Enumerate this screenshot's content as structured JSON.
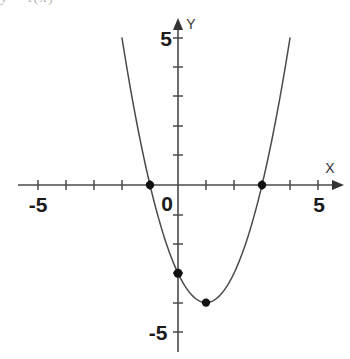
{
  "figure": {
    "title_fragment": "y = f(x)",
    "background_color": "#ffffff",
    "curve_color": "#4a4a4a",
    "axis_color": "#4a4a4a",
    "point_color": "#111111",
    "label_color": "#1a1a1a"
  },
  "axes": {
    "x_axis_name": "X",
    "y_axis_name": "Y",
    "origin_label": "0",
    "x_min_label": "-5",
    "x_max_label": "5",
    "y_max_label": "5",
    "y_min_label": "-5"
  },
  "chart_data": {
    "type": "line",
    "title": "y = f(x)",
    "xlabel": "X",
    "ylabel": "Y",
    "xlim": [
      -5,
      5
    ],
    "ylim": [
      -5,
      5
    ],
    "grid": false,
    "legend": "none",
    "xticks": [
      -5,
      -4,
      -3,
      -2,
      -1,
      0,
      1,
      2,
      3,
      4,
      5
    ],
    "yticks": [
      -5,
      -4,
      -3,
      -2,
      -1,
      0,
      1,
      2,
      3,
      4,
      5
    ],
    "xtick_labels": [
      "-5",
      "",
      "",
      "",
      "",
      "0",
      "",
      "",
      "",
      "",
      "5"
    ],
    "ytick_labels": [
      "-5",
      "",
      "",
      "",
      "",
      "",
      "",
      "",
      "",
      "",
      "5"
    ],
    "series": [
      {
        "name": "parabola",
        "equation": "y = x^2 - 2x - 3",
        "vertex": [
          1,
          -4
        ],
        "roots": [
          -1,
          3
        ],
        "y_intercept": -3,
        "x": [
          -1.85,
          -1.6,
          -1.4,
          -1.2,
          -1,
          -0.8,
          -0.6,
          -0.4,
          -0.2,
          0,
          0.25,
          0.5,
          0.75,
          1,
          1.25,
          1.5,
          1.75,
          2,
          2.25,
          2.5,
          2.75,
          3,
          3.2,
          3.4,
          3.6,
          3.85
        ],
        "y": [
          4.12,
          2.76,
          1.76,
          0.84,
          0,
          -0.76,
          -1.44,
          -2.04,
          -2.56,
          -3,
          -3.44,
          -3.75,
          -3.94,
          -4,
          -3.94,
          -3.75,
          -3.44,
          -3,
          -2.44,
          -1.75,
          -0.94,
          0,
          0.84,
          1.76,
          2.76,
          4.12
        ]
      }
    ],
    "marked_points": [
      {
        "label": "root-left",
        "x": -1,
        "y": 0
      },
      {
        "label": "root-right",
        "x": 3,
        "y": 0
      },
      {
        "label": "y-intercept",
        "x": 0,
        "y": -3
      },
      {
        "label": "vertex",
        "x": 1,
        "y": -4
      }
    ]
  }
}
